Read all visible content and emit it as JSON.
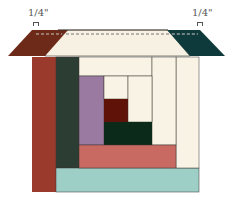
{
  "diagram": {
    "labels": {
      "left_seam": "1/4\"",
      "right_seam": "1/4\""
    },
    "colors": {
      "roof_left": "#6e2a18",
      "roof_center": "#f6f1e2",
      "roof_right": "#0f3a3c",
      "brown_column": "#9a3a2c",
      "dark_green_column": "#2c3d34",
      "cream": "#f8f3e4",
      "purple": "#9a7aa0",
      "dark_red": "#5e1208",
      "dark_green_block": "#0c2a1a",
      "salmon": "#c96a62",
      "teal_strip": "#9ecfc6",
      "outline": "#3a3530"
    }
  }
}
